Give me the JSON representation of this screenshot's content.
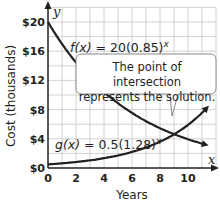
{
  "chart_data": {
    "type": "line",
    "title": "",
    "xlabel": "Years",
    "ylabel": "Cost (thousands)",
    "x_axis_var": "x",
    "y_axis_var": "y",
    "xlim": [
      0,
      12
    ],
    "ylim": [
      0,
      22
    ],
    "x_ticks": [
      "0",
      "2",
      "4",
      "6",
      "8",
      "10"
    ],
    "y_ticks": [
      "$0",
      "$4",
      "$8",
      "$12",
      "$16",
      "$20"
    ],
    "grid": true,
    "series": [
      {
        "name": "f(x) = 20(0.85)^x",
        "label_fn": "f(x)",
        "label_rhs": " = 20(0.85)",
        "label_exp": "x",
        "base_coef": 20,
        "base": 0.85,
        "x": [
          0,
          1,
          2,
          3,
          4,
          5,
          6,
          7,
          8,
          9,
          10,
          11,
          12
        ],
        "values": [
          20,
          17,
          14.45,
          12.28,
          10.44,
          8.87,
          7.54,
          6.41,
          5.45,
          4.63,
          3.94,
          3.35,
          2.84
        ]
      },
      {
        "name": "g(x) = 0.5(1.28)^x",
        "label_fn": "g(x)",
        "label_rhs": " = 0.5(1.28)",
        "label_exp": "x",
        "base_coef": 0.5,
        "base": 1.28,
        "x": [
          0,
          1,
          2,
          3,
          4,
          5,
          6,
          7,
          8,
          9,
          10,
          11,
          12
        ],
        "values": [
          0.5,
          0.64,
          0.82,
          1.05,
          1.34,
          1.72,
          2.2,
          2.82,
          3.61,
          4.61,
          5.9,
          7.56,
          9.67
        ]
      }
    ],
    "annotations": [
      {
        "text": "The point of intersection represents the solution.",
        "points_to": [
          9.1,
          4.4
        ]
      }
    ]
  },
  "callout": {
    "line1": "The point of intersection",
    "line2": "represents the solution."
  },
  "colors": {
    "curve": "#231f20",
    "grid": "#c9c7c8",
    "axis": "#231f20"
  }
}
